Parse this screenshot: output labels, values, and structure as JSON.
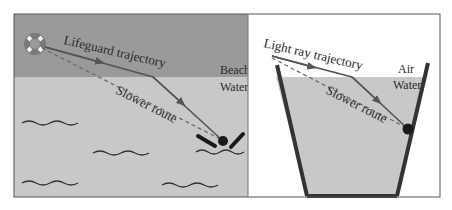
{
  "left_panel": {
    "title": "Lifeguard analogy",
    "labels": {
      "trajectory": "Lifeguard trajectory",
      "slower": "Slower route",
      "beach": "Beach",
      "water": "Water"
    },
    "icons": [
      "lifebuoy-icon",
      "swimmer-icon",
      "wave-icon"
    ],
    "colors": {
      "beach": "#999999",
      "water": "#c8c8c8",
      "line": "#555555"
    }
  },
  "right_panel": {
    "title": "Light refraction",
    "labels": {
      "trajectory": "Light ray trajectory",
      "slower": "Slower route",
      "air": "Air",
      "water": "Water"
    },
    "colors": {
      "air": "#ffffff",
      "water": "#c8c8c8",
      "container": "#333333"
    }
  }
}
